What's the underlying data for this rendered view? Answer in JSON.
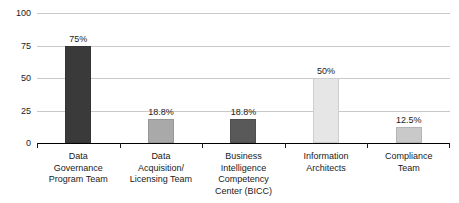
{
  "chart_data": {
    "type": "bar",
    "title": "",
    "subtitle": "",
    "xlabel": "",
    "ylabel": "",
    "ylim": [
      0,
      100
    ],
    "yticks": [
      0,
      25,
      50,
      75,
      100
    ],
    "ytick_labels": [
      "0",
      "25",
      "50",
      "75",
      "100"
    ],
    "grid": true,
    "legend": false,
    "legend_position": "none",
    "categories": [
      "Data Governance Program Team",
      "Data Acquisition/ Licensing Team",
      "Business Intelligence Competency Center (BICC)",
      "Information Architects",
      "Compliance Team"
    ],
    "category_lines": [
      [
        "Data",
        "Governance",
        "Program Team"
      ],
      [
        "Data",
        "Acquisition/",
        "Licensing Team"
      ],
      [
        "Business",
        "Intelligence",
        "Competency",
        "Center (BICC)"
      ],
      [
        "Information",
        "Architects"
      ],
      [
        "Compliance",
        "Team"
      ]
    ],
    "values": [
      75,
      18.8,
      18.8,
      50,
      12.5
    ],
    "data_labels": [
      "75%",
      "18.8%",
      "18.8%",
      "50%",
      "12.5%"
    ],
    "bar_colors": [
      "#3a3a3a",
      "#a9a9a9",
      "#595959",
      "#e6e6e6",
      "#c9c9c9"
    ],
    "axis_color": "#000000",
    "gridline_color": "#c9c9c9",
    "text_color": "#1a1a1a",
    "background": "#ffffff"
  }
}
